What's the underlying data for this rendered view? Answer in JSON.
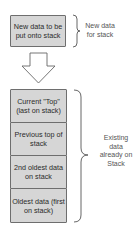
{
  "diagram": {
    "new_item": {
      "label": "New data to be put onto stack",
      "annotation": "New data for stack"
    },
    "arrow": {
      "direction": "down",
      "icon": "hollow-down-arrow"
    },
    "stack": {
      "items": [
        {
          "label": "Current \"Top\" (last on stack)"
        },
        {
          "label": "Previous top of stack"
        },
        {
          "label": "2nd oldest data on stack"
        },
        {
          "label": "Oldest data (first on stack)"
        }
      ],
      "annotation": "Existing data already on Stack"
    },
    "colors": {
      "box_fill": "#d6d6d6",
      "box_border": "#6e6e6e",
      "line": "#555555",
      "text": "#333333"
    }
  }
}
